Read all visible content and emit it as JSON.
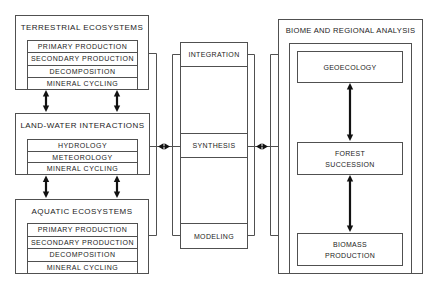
{
  "colors": {
    "background": "#ffffff",
    "line": "#505050",
    "arrow": "#111111",
    "text": "#1c1c1c"
  },
  "left_panel": {
    "terrestrial": {
      "title": "TERRESTRIAL ECOSYSTEMS",
      "items": [
        "PRIMARY PRODUCTION",
        "SECONDARY PRODUCTION",
        "DECOMPOSITION",
        "MINERAL CYCLING"
      ]
    },
    "land_water": {
      "title": "LAND-WATER INTERACTIONS",
      "items": [
        "HYDROLOGY",
        "METEOROLOGY",
        "MINERAL CYCLING"
      ]
    },
    "aquatic": {
      "title": "AQUATIC ECOSYSTEMS",
      "items": [
        "PRIMARY PRODUCTION",
        "SECONDARY PRODUCTION",
        "DECOMPOSITION",
        "MINERAL CYCLING"
      ]
    }
  },
  "center_column": {
    "integration": "INTEGRATION",
    "synthesis": "SYNTHESIS",
    "modeling": "MODELING"
  },
  "right_panel": {
    "title": "BIOME AND REGIONAL ANALYSIS",
    "geoecology": [
      "GEOECOLOGY"
    ],
    "forest_succession": [
      "FOREST",
      "SUCCESSION"
    ],
    "biomass_production": [
      "BIOMASS",
      "PRODUCTION"
    ]
  },
  "connections": [
    {
      "from": "TERRESTRIAL ECOSYSTEMS",
      "to": "LAND-WATER INTERACTIONS",
      "type": "bidirectional",
      "count": 2
    },
    {
      "from": "LAND-WATER INTERACTIONS",
      "to": "AQUATIC ECOSYSTEMS",
      "type": "bidirectional",
      "count": 2
    },
    {
      "from": "LEFT PANEL",
      "to": "SYNTHESIS",
      "type": "bidirectional"
    },
    {
      "from": "SYNTHESIS",
      "to": "BIOME AND REGIONAL ANALYSIS",
      "type": "bidirectional"
    },
    {
      "from": "GEOECOLOGY",
      "to": "FOREST SUCCESSION",
      "type": "bidirectional"
    },
    {
      "from": "FOREST SUCCESSION",
      "to": "BIOMASS PRODUCTION",
      "type": "bidirectional"
    }
  ]
}
